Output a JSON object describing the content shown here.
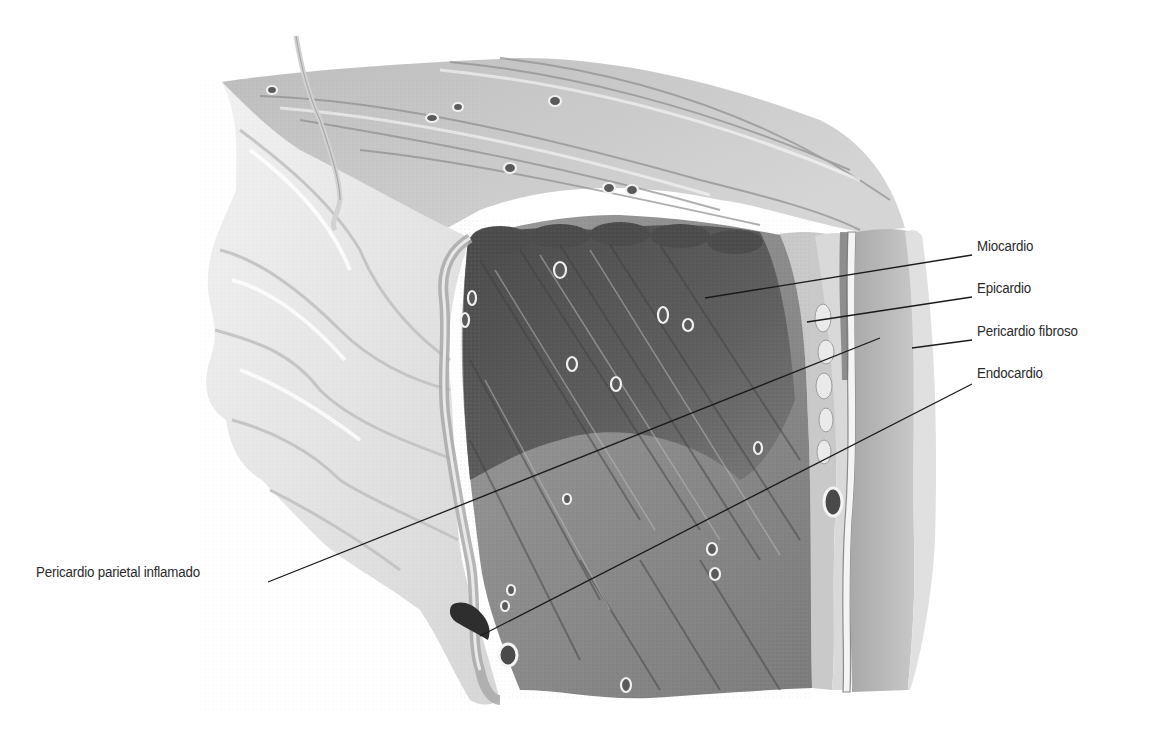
{
  "diagram": {
    "colors": {
      "background": "#ffffff",
      "label_text": "#2a2a2a",
      "leader_line": "#1a1a1a",
      "pericardium_inflamed": "#e6e6e6",
      "myocardium_dark": "#555555",
      "myocardium_mid": "#8a8a8a",
      "epicardium": "#b4b4b4",
      "fibrous_pericardium": "#cfcfcf"
    },
    "labels": [
      {
        "id": "miocardio",
        "text": "Miocardio",
        "x": 977,
        "y": 246,
        "line": [
          705,
          298,
          972,
          255
        ]
      },
      {
        "id": "epicardio",
        "text": "Epicardio",
        "x": 977,
        "y": 288,
        "line": [
          807,
          322,
          972,
          297
        ]
      },
      {
        "id": "pericardio-fibroso",
        "text": "Pericardio fibroso",
        "x": 977,
        "y": 331,
        "line": [
          912,
          348,
          972,
          340
        ]
      },
      {
        "id": "endocardio",
        "text": "Endocardio",
        "x": 977,
        "y": 373,
        "line": [
          480,
          636,
          972,
          384
        ]
      },
      {
        "id": "pericardio-parietal-inflamado",
        "text": "Pericardio parietal inflamado",
        "x": 36,
        "y": 572,
        "line": [
          268,
          582,
          880,
          338
        ],
        "anchor": "left"
      }
    ]
  }
}
